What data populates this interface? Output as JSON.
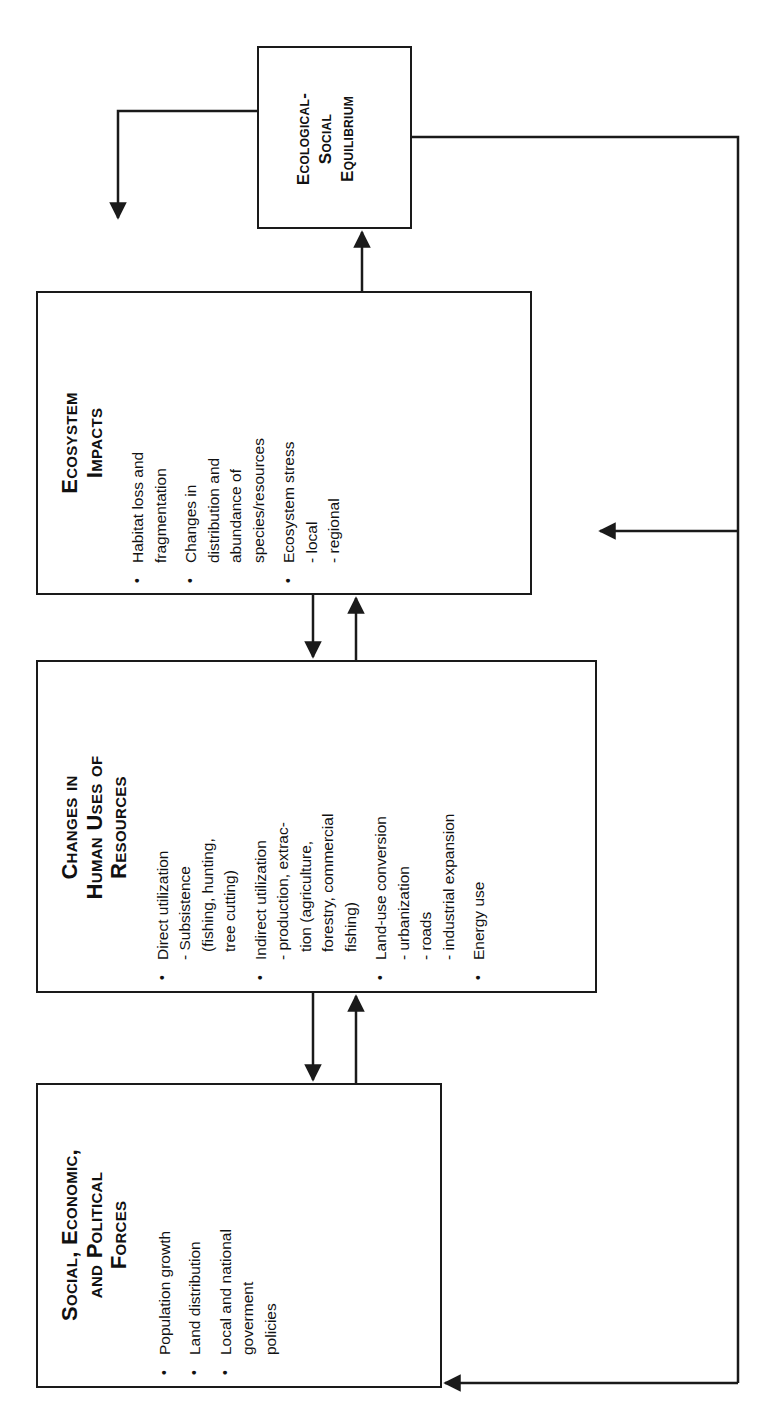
{
  "diagram": {
    "type": "flowchart",
    "orientation": "rotated -90deg",
    "boxes": [
      {
        "id": "social-economic-political-forces",
        "title_lines": [
          "Social, Economic,",
          "and Political",
          "Forces"
        ],
        "items": [
          {
            "text": "Population growth",
            "subs": []
          },
          {
            "text": "Land distribution",
            "subs": []
          },
          {
            "text": "Local and national government policies",
            "lines": [
              "Local and national",
              "goverment",
              "policies"
            ],
            "subs": []
          }
        ]
      },
      {
        "id": "changes-in-human-uses-of-resources",
        "title_lines": [
          "Changes in",
          "Human Uses of",
          "Resources"
        ],
        "items": [
          {
            "lines": [
              "Direct utilization"
            ],
            "subs": [
              "- Subsistence",
              "  (fishing, hunting,",
              "  tree cutting)"
            ]
          },
          {
            "lines": [
              "Indirect utilization"
            ],
            "subs": [
              "- production,  extrac-",
              "  tion (agriculture,",
              "  forestry, commercial",
              "  fishing)"
            ]
          },
          {
            "lines": [
              "Land-use conversion"
            ],
            "subs": [
              "- urbanization",
              "- roads",
              "- industrial expansion"
            ]
          },
          {
            "lines": [
              "Energy use"
            ],
            "subs": []
          }
        ]
      },
      {
        "id": "ecosystem-impacts",
        "title_lines": [
          "Ecosystem",
          "Impacts"
        ],
        "items": [
          {
            "lines": [
              "Habitat loss and",
              "fragmentation"
            ],
            "subs": []
          },
          {
            "lines": [
              "Changes in",
              "distribution and",
              "abundance of",
              "species/resources"
            ],
            "subs": []
          },
          {
            "lines": [
              "Ecosystem stress"
            ],
            "subs": [
              "- local",
              "- regional"
            ]
          }
        ]
      },
      {
        "id": "ecological-social-equilibrium",
        "title_lines": [
          "Ecological-",
          "Social",
          "Equilibrium"
        ],
        "items": []
      }
    ],
    "connections": [
      {
        "from": "social-economic-political-forces",
        "to": "changes-in-human-uses-of-resources"
      },
      {
        "from": "changes-in-human-uses-of-resources",
        "to": "social-economic-political-forces"
      },
      {
        "from": "changes-in-human-uses-of-resources",
        "to": "ecosystem-impacts"
      },
      {
        "from": "ecosystem-impacts",
        "to": "changes-in-human-uses-of-resources"
      },
      {
        "from": "ecosystem-impacts",
        "to": "ecological-social-equilibrium"
      },
      {
        "from": "ecological-social-equilibrium",
        "to": "open-end-left"
      },
      {
        "from": "ecological-social-equilibrium",
        "to": "changes-in-human-uses-of-resources"
      },
      {
        "from": "ecological-social-equilibrium",
        "to": "social-economic-political-forces"
      }
    ],
    "bullet_glyph": "•",
    "colors": {
      "line": "#1a1a1a",
      "background": "#ffffff",
      "text": "#111111"
    }
  }
}
